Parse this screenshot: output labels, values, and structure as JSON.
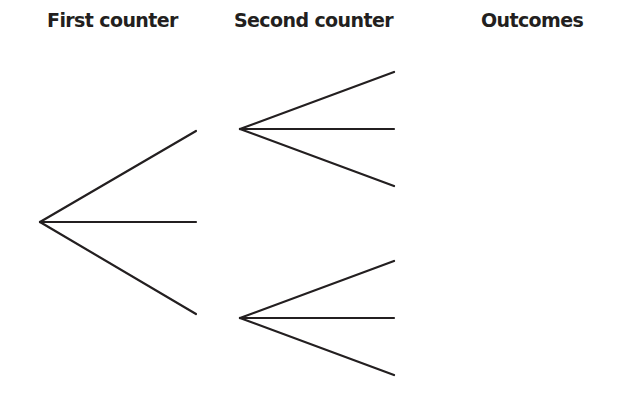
{
  "diagram": {
    "type": "tree-diagram",
    "headers": {
      "first": "First counter",
      "second": "Second counter",
      "outcomes": "Outcomes"
    },
    "colors": {
      "line": "#231f20",
      "text": "#231f20",
      "background": "#ffffff"
    },
    "first_stage": {
      "root": [
        40,
        222
      ],
      "branch_ends": [
        [
          196,
          131
        ],
        [
          196,
          222
        ],
        [
          196,
          314
        ]
      ]
    },
    "second_stage": [
      {
        "root": [
          240,
          129
        ],
        "branch_ends": [
          [
            394,
            72
          ],
          [
            394,
            129
          ],
          [
            394,
            186
          ]
        ]
      },
      {
        "root": [
          240,
          318
        ],
        "branch_ends": [
          [
            394,
            261
          ],
          [
            394,
            318
          ],
          [
            394,
            375
          ]
        ]
      }
    ],
    "outcomes": []
  }
}
